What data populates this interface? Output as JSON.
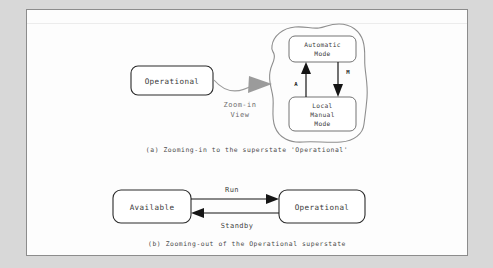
{
  "figure": {
    "panel_a": {
      "caption": "(a) Zooming-in to the superstate 'Operational'",
      "source_state": "Operational",
      "zoom_label_line1": "Zoom-in",
      "zoom_label_line2": "View",
      "superstate_children": [
        {
          "name": "Automatic Mode",
          "line1": "Automatic",
          "line2": "Mode"
        },
        {
          "name": "Local Manual Mode",
          "line1": "Local",
          "line2": "Manual",
          "line3": "Mode"
        }
      ],
      "transitions": [
        {
          "label": "A",
          "from": "Local Manual Mode",
          "to": "Automatic Mode",
          "direction": "up"
        },
        {
          "label": "M",
          "from": "Automatic Mode",
          "to": "Local Manual Mode",
          "direction": "down"
        }
      ]
    },
    "panel_b": {
      "caption": "(b) Zooming-out of the Operational superstate",
      "states": [
        {
          "name": "Available"
        },
        {
          "name": "Operational"
        }
      ],
      "transitions": [
        {
          "label": "Run",
          "from": "Available",
          "to": "Operational",
          "direction": "right"
        },
        {
          "label": "Standby",
          "from": "Operational",
          "to": "Available",
          "direction": "left"
        }
      ]
    }
  },
  "colors": {
    "page_background": "#fdfdfd",
    "outer_background": "#d8d8d8",
    "page_border": "#8c8c8c",
    "state_outline": "#2a2a2a",
    "inner_outline": "#5a5a5a",
    "blob_outline": "#8e8e8e",
    "zoom_arrow": "#9b9b9b",
    "transition_arrow": "#151515",
    "caption_text": "#4a4a4a"
  }
}
